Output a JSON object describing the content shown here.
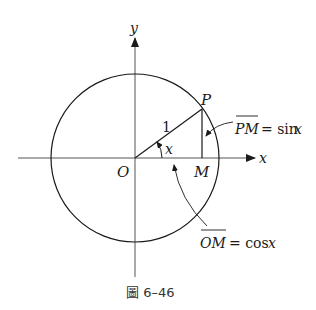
{
  "diagram": {
    "labels": {
      "y_axis": "y",
      "x_axis": "x",
      "origin": "O",
      "point_p": "P",
      "point_m": "M",
      "radius": "1",
      "angle": "x"
    },
    "annotations": {
      "sin_lhs": "PM",
      "sin_rhs": "= sin",
      "sin_var": "x",
      "cos_lhs": "OM",
      "cos_rhs": "= cos",
      "cos_var": "x"
    },
    "caption": "圖 6–46",
    "colors": {
      "stroke": "#1a1a1a",
      "axis": "#444444",
      "background": "#ffffff"
    }
  }
}
